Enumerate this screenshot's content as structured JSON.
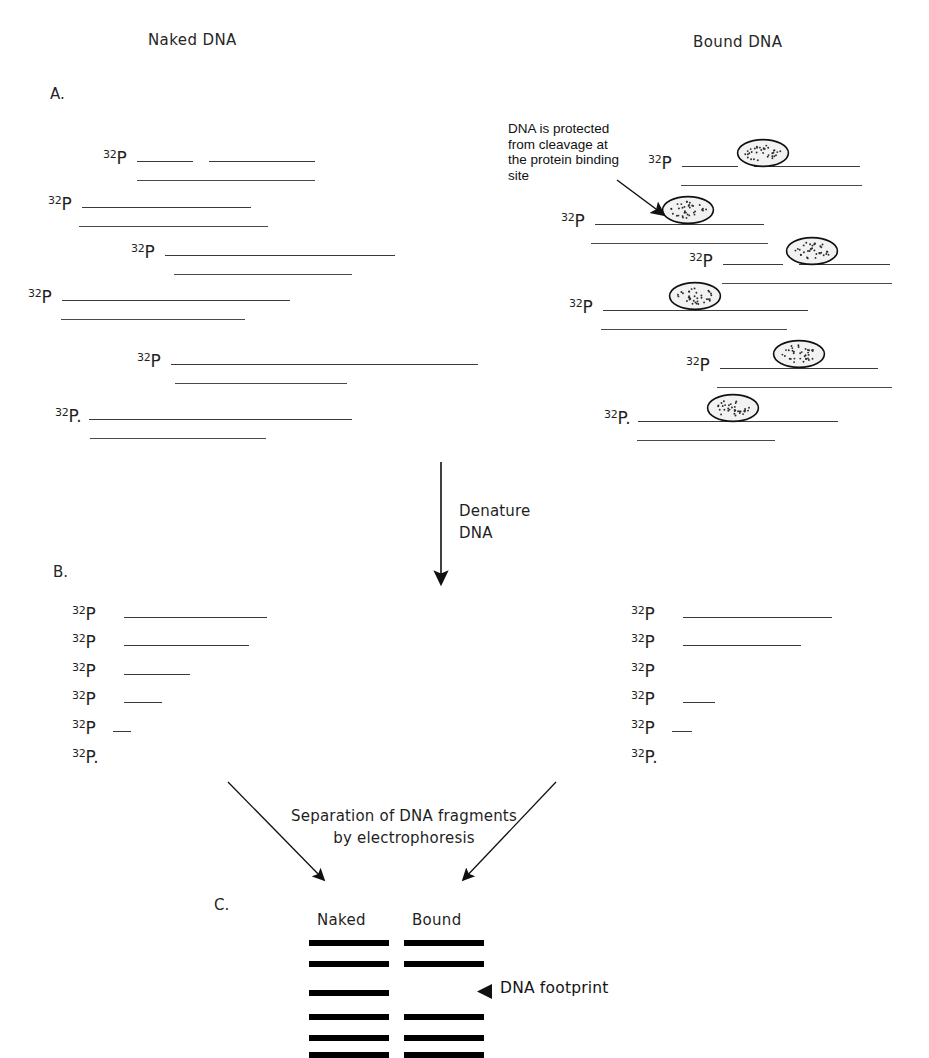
{
  "figure": {
    "title_left": "Naked DNA",
    "title_right": "Bound DNA",
    "panel_a_letter": "A.",
    "panel_b_letter": "B.",
    "panel_c_letter": "C.",
    "isotope_superscript": "32",
    "isotope_element": "P",
    "annotation_note": "DNA is protected\nfrom cleavage at\nthe protein binding\nsite",
    "step_denature": "Denature\nDNA",
    "step_separation": "Separation of DNA fragments\nby electrophoresis",
    "gel_lane_naked": "Naked",
    "gel_lane_bound": "Bound",
    "footprint_label": "DNA footprint",
    "colors": {
      "ink": "#1a1a1a",
      "strand": "#3a3a3a",
      "band": "#000000",
      "protein_fill": "#f2f2f2",
      "protein_stroke": "#111111",
      "background": "#ffffff"
    }
  },
  "chart_data": {
    "type": "diagram",
    "panels": [
      {
        "id": "A",
        "label": "A.",
        "description": "End-labelled duplex DNA cleaved at a single random position; naked DNA is cut everywhere, bound DNA is protected where the protein sits.",
        "columns": [
          {
            "name": "Naked DNA",
            "rows": [
              {
                "index": 1,
                "label_x": 103,
                "top_y": 161,
                "cut_at": 56,
                "top_end": 315,
                "bottom_start": 137,
                "bottom_end": 315,
                "protein": false
              },
              {
                "index": 2,
                "label_x": 48,
                "top_y": 207,
                "cut_at": 169,
                "top_end": 261,
                "bottom_start": 79,
                "bottom_end": 268,
                "protein": false
              },
              {
                "index": 3,
                "label_x": 131,
                "top_y": 255,
                "cut_at": 230,
                "top_end": 350,
                "bottom_start": 174,
                "bottom_end": 352,
                "protein": false
              },
              {
                "index": 4,
                "label_x": 28,
                "top_y": 300,
                "cut_at": 228,
                "top_end": 233,
                "bottom_start": 61,
                "bottom_end": 245,
                "protein": false
              },
              {
                "index": 5,
                "label_x": 137,
                "top_y": 364,
                "cut_at": 307,
                "top_end": 345,
                "bottom_start": 175,
                "bottom_end": 347,
                "protein": false
              },
              {
                "index": 6,
                "label_x": 55,
                "top_y": 419,
                "cut_at": 263,
                "top_end": 263,
                "bottom_start": 90,
                "bottom_end": 266,
                "protein": false
              }
            ]
          },
          {
            "name": "Bound DNA",
            "rows": [
              {
                "index": 1,
                "label_x": 648,
                "top_y": 166,
                "cut_at": 56,
                "top_end": 860,
                "bottom_start": 681,
                "bottom_end": 862,
                "protein": true,
                "protein_x": 763,
                "protein_y": 153
              },
              {
                "index": 2,
                "label_x": 561,
                "top_y": 224,
                "cut_at": 169,
                "top_end": 765,
                "bottom_start": 591,
                "bottom_end": 768,
                "protein": true,
                "protein_x": 688,
                "protein_y": 210
              },
              {
                "index": 3,
                "label_x": 689,
                "top_y": 264,
                "cut_at": 60,
                "top_end": 890,
                "bottom_start": 722,
                "bottom_end": 892,
                "protein": true,
                "protein_x": 812,
                "protein_y": 251
              },
              {
                "index": 4,
                "label_x": 569,
                "top_y": 310,
                "cut_at": 205,
                "top_end": 782,
                "bottom_start": 601,
                "bottom_end": 787,
                "protein": true,
                "protein_x": 695,
                "protein_y": 296
              },
              {
                "index": 5,
                "label_x": 686,
                "top_y": 368,
                "cut_at": 158,
                "top_end": 890,
                "bottom_start": 717,
                "bottom_end": 892,
                "protein": true,
                "protein_x": 799,
                "protein_y": 354
              },
              {
                "index": 6,
                "label_x": 604,
                "top_y": 421,
                "cut_at": 200,
                "top_end": 772,
                "bottom_start": 637,
                "bottom_end": 775,
                "protein": true,
                "protein_x": 733,
                "protein_y": 408
              }
            ]
          }
        ]
      },
      {
        "id": "B",
        "label": "B.",
        "description": "After denaturation, only the labelled single strands remain; bound sample is missing the fragments corresponding to the protected region.",
        "columns": [
          {
            "name": "Naked",
            "fragment_lengths": [
              143,
              125,
              96,
              57,
              26,
              0
            ],
            "rows": [
              {
                "index": 1,
                "label_x": 72,
                "y": 617,
                "start": 124,
                "end": 267
              },
              {
                "index": 2,
                "label_x": 72,
                "y": 645,
                "start": 124,
                "end": 249
              },
              {
                "index": 3,
                "label_x": 72,
                "y": 674,
                "start": 124,
                "end": 190
              },
              {
                "index": 4,
                "label_x": 72,
                "y": 702,
                "start": 124,
                "end": 162
              },
              {
                "index": 5,
                "label_x": 72,
                "y": 731,
                "start": 113,
                "end": 131
              },
              {
                "index": 6,
                "label_x": 72,
                "y": 760,
                "start": 0,
                "end": 0
              }
            ]
          },
          {
            "name": "Bound",
            "fragment_lengths": [
              151,
              127,
              null,
              48,
              21,
              0
            ],
            "missing_bands": [
              3
            ],
            "rows": [
              {
                "index": 1,
                "label_x": 631,
                "y": 617,
                "start": 683,
                "end": 832
              },
              {
                "index": 2,
                "label_x": 631,
                "y": 645,
                "start": 683,
                "end": 801
              },
              {
                "index": 3,
                "label_x": 631,
                "y": 674,
                "start": 0,
                "end": 0
              },
              {
                "index": 4,
                "label_x": 631,
                "y": 702,
                "start": 683,
                "end": 715
              },
              {
                "index": 5,
                "label_x": 631,
                "y": 731,
                "start": 672,
                "end": 692
              },
              {
                "index": 6,
                "label_x": 631,
                "y": 760,
                "start": 0,
                "end": 0
              }
            ]
          }
        ]
      },
      {
        "id": "C",
        "label": "C.",
        "description": "Autoradiograph of the sequencing gel. A gap (footprint) appears in the bound lane.",
        "lanes": [
          {
            "name": "Naked",
            "x": 309,
            "width": 80,
            "bands_y": [
              940,
              961,
              990,
              1014,
              1035,
              1052
            ],
            "band_count": 6
          },
          {
            "name": "Bound",
            "x": 404,
            "width": 80,
            "bands_y": [
              940,
              961,
              1014,
              1035,
              1052
            ],
            "band_count": 5,
            "missing_y": [
              990
            ]
          }
        ],
        "annotation": {
          "text": "DNA footprint",
          "points_to_y": 990,
          "arrow_x": 484
        }
      }
    ]
  }
}
